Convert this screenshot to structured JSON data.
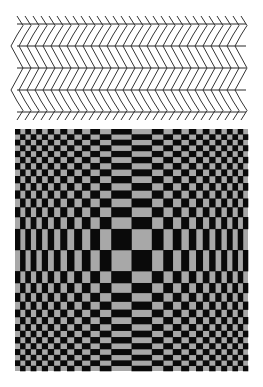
{
  "figure": {
    "width": 263,
    "height": 387,
    "background": "#ffffff"
  },
  "zigzag_illusion": {
    "name": "Zollner-style chevron illusion",
    "x_start": 17,
    "x_end": 246,
    "line_ys": [
      24,
      46,
      68,
      90,
      112
    ],
    "chevron_spacing": 8,
    "chevron_half_width": 6,
    "line_color": "#2a2a2a",
    "chevron_color": "#333333",
    "rows": [
      {
        "y_top": 16,
        "y_bottom": 35,
        "direction": "right"
      },
      {
        "y_top": 35,
        "y_bottom": 57,
        "direction": "left"
      },
      {
        "y_top": 57,
        "y_bottom": 79,
        "direction": "right"
      },
      {
        "y_top": 79,
        "y_bottom": 101,
        "direction": "left"
      },
      {
        "y_top": 101,
        "y_bottom": 120,
        "direction": "right"
      }
    ]
  },
  "checker_illusion": {
    "name": "Bulging checkerboard illusion",
    "x": 15,
    "y": 129,
    "width": 233,
    "height": 242,
    "columns": 30,
    "rows": 30,
    "dark_color": "#0a0a0a",
    "light_color": "#a8a8a8",
    "bulge_strength": 0.55
  }
}
